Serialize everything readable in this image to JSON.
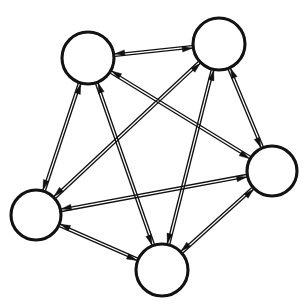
{
  "figure": {
    "name": "complete-directed-graph",
    "type": "diagram",
    "subtype": "directed-graph",
    "title": "",
    "caption": "",
    "background_color": "#ffffff",
    "width": 307,
    "height": 304
  },
  "style": {
    "node_fill": "#ffffff",
    "node_stroke": "#121212",
    "node_stroke_width": 3.1,
    "edge_color": "#111111",
    "edge_stroke_width": 1.35,
    "edge_rendering": "double-parallel-line",
    "edge_pair_offset": 2.6,
    "arrow_length": 10,
    "arrow_half_width": 2.9,
    "arrow_style": "solid-narrow-barb"
  },
  "graph": {
    "node_count": 5,
    "edge_count": 10,
    "directed": true,
    "complete": true,
    "bidirectional_all_pairs": true,
    "nodes": [
      {
        "id": "n1",
        "label": "",
        "cx": 88,
        "cy": 58,
        "r": 26
      },
      {
        "id": "n2",
        "label": "",
        "cx": 219,
        "cy": 44,
        "r": 26
      },
      {
        "id": "n3",
        "label": "",
        "cx": 272,
        "cy": 171,
        "r": 25
      },
      {
        "id": "n4",
        "label": "",
        "cx": 162,
        "cy": 270,
        "r": 26
      },
      {
        "id": "n5",
        "label": "",
        "cx": 36,
        "cy": 215,
        "r": 25
      }
    ],
    "edges": [
      {
        "id": "e-n1-n2",
        "source": "n1",
        "target": "n2",
        "bidirectional": true
      },
      {
        "id": "e-n1-n3",
        "source": "n1",
        "target": "n3",
        "bidirectional": true
      },
      {
        "id": "e-n1-n4",
        "source": "n1",
        "target": "n4",
        "bidirectional": true
      },
      {
        "id": "e-n1-n5",
        "source": "n1",
        "target": "n5",
        "bidirectional": true
      },
      {
        "id": "e-n2-n3",
        "source": "n2",
        "target": "n3",
        "bidirectional": true
      },
      {
        "id": "e-n2-n4",
        "source": "n2",
        "target": "n4",
        "bidirectional": true
      },
      {
        "id": "e-n2-n5",
        "source": "n2",
        "target": "n5",
        "bidirectional": true
      },
      {
        "id": "e-n3-n4",
        "source": "n3",
        "target": "n4",
        "bidirectional": true
      },
      {
        "id": "e-n3-n5",
        "source": "n3",
        "target": "n5",
        "bidirectional": true
      },
      {
        "id": "e-n4-n5",
        "source": "n4",
        "target": "n5",
        "bidirectional": true
      }
    ]
  }
}
